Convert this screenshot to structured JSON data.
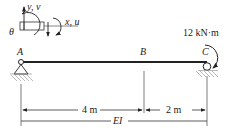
{
  "diagram": {
    "type": "beam",
    "points": {
      "A": "A",
      "B": "B",
      "C": "C"
    },
    "load": {
      "label": "12 kN·m",
      "type": "moment",
      "location": "C",
      "direction": "clockwise"
    },
    "supports": [
      {
        "point": "A",
        "type": "pin"
      },
      {
        "point": "C",
        "type": "roller"
      }
    ],
    "dimensions": [
      {
        "label": "4 m",
        "from": "A",
        "to": "B"
      },
      {
        "label": "2 m",
        "from": "B",
        "to": "C"
      }
    ],
    "stiffness_label": "EI",
    "sign_convention": {
      "y_axis": "y, v",
      "x_axis": "x, u",
      "rotation": "θ"
    }
  }
}
